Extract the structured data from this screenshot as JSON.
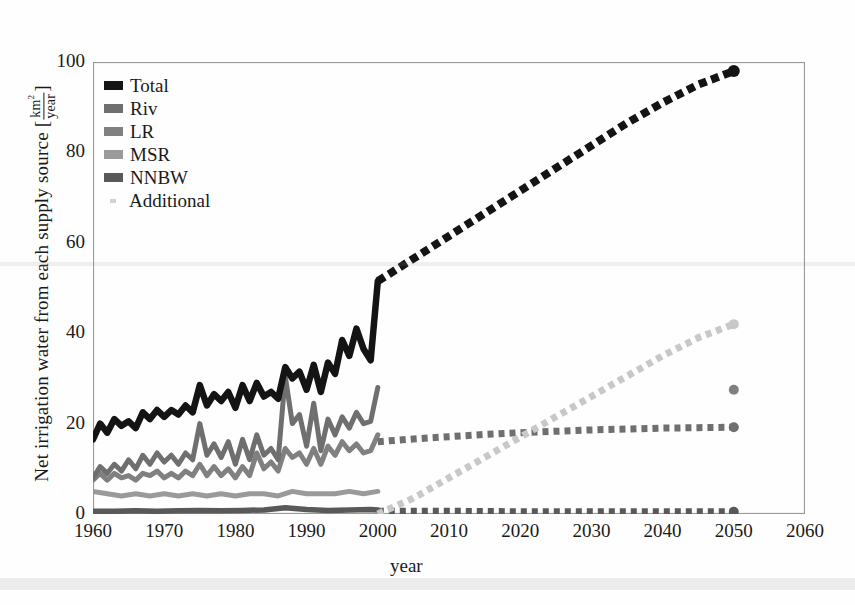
{
  "chart_data": {
    "type": "line",
    "title": "",
    "xlabel": "year",
    "ylabel": "Net irrigation water from each supply source",
    "ylabel_unit_num": "km",
    "ylabel_unit_num_sup": "2",
    "ylabel_unit_den": "year",
    "ylabel_bracket_open": "[",
    "ylabel_bracket_close": "]",
    "xlim": [
      1960,
      2060
    ],
    "ylim": [
      0,
      100
    ],
    "xticks": [
      1960,
      1970,
      1980,
      1990,
      2000,
      2010,
      2020,
      2030,
      2040,
      2050,
      2060
    ],
    "yticks": [
      0,
      20,
      40,
      60,
      80,
      100
    ],
    "grid": false,
    "legend_position": "upper-left",
    "historical_range": [
      1960,
      2000
    ],
    "projection_range": [
      2000,
      2050
    ],
    "series": [
      {
        "name": "Total",
        "color": "#141414",
        "style_historical": "solid",
        "style_projection": "dotted",
        "x": [
          1960,
          1961,
          1962,
          1963,
          1964,
          1965,
          1966,
          1967,
          1968,
          1969,
          1970,
          1971,
          1972,
          1973,
          1974,
          1975,
          1976,
          1977,
          1978,
          1979,
          1980,
          1981,
          1982,
          1983,
          1984,
          1985,
          1986,
          1987,
          1988,
          1989,
          1990,
          1991,
          1992,
          1993,
          1994,
          1995,
          1996,
          1997,
          1998,
          1999,
          2000
        ],
        "values": [
          16.5,
          20.0,
          18.0,
          21.0,
          19.5,
          20.5,
          19.0,
          22.5,
          21.0,
          23.0,
          21.5,
          23.0,
          22.0,
          24.0,
          22.5,
          28.5,
          24.0,
          26.5,
          25.0,
          27.0,
          23.5,
          28.5,
          25.0,
          29.0,
          26.0,
          27.0,
          25.5,
          32.5,
          30.0,
          31.5,
          27.5,
          33.0,
          27.0,
          33.5,
          31.0,
          38.5,
          35.0,
          41.0,
          36.5,
          34.0,
          51.5
        ],
        "projection_x": [
          2000,
          2005,
          2010,
          2015,
          2020,
          2025,
          2030,
          2035,
          2040,
          2045,
          2050
        ],
        "projection_values": [
          51.5,
          56.5,
          61.5,
          66.5,
          71.5,
          76.5,
          81.5,
          86.5,
          91.0,
          95.0,
          98.0
        ],
        "endpoint_2050": 98.0
      },
      {
        "name": "Riv",
        "color": "#6f6f6f",
        "style_historical": "solid",
        "style_projection": "dotted",
        "x": [
          1960,
          1961,
          1962,
          1963,
          1964,
          1965,
          1966,
          1967,
          1968,
          1969,
          1970,
          1971,
          1972,
          1973,
          1974,
          1975,
          1976,
          1977,
          1978,
          1979,
          1980,
          1981,
          1982,
          1983,
          1984,
          1985,
          1986,
          1987,
          1988,
          1989,
          1990,
          1991,
          1992,
          1993,
          1994,
          1995,
          1996,
          1997,
          1998,
          1999,
          2000
        ],
        "values": [
          8.0,
          10.5,
          9.0,
          11.0,
          9.5,
          12.0,
          10.0,
          13.0,
          11.0,
          13.5,
          11.5,
          13.0,
          11.0,
          13.5,
          12.0,
          20.0,
          13.0,
          15.5,
          12.5,
          16.0,
          11.0,
          16.5,
          12.0,
          17.5,
          13.0,
          14.5,
          12.0,
          30.5,
          20.0,
          22.0,
          15.0,
          24.5,
          14.0,
          21.0,
          17.5,
          21.5,
          19.0,
          22.5,
          20.0,
          20.5,
          28.0
        ],
        "projection_x": [
          2000,
          2005,
          2010,
          2015,
          2020,
          2025,
          2030,
          2035,
          2040,
          2045,
          2050
        ],
        "projection_values": [
          16.0,
          16.6,
          17.1,
          17.6,
          18.0,
          18.3,
          18.6,
          18.8,
          19.0,
          19.1,
          19.2
        ],
        "endpoint_2050": 19.2
      },
      {
        "name": "LR",
        "color": "#808080",
        "style_historical": "solid",
        "style_projection": "marker-only",
        "x": [
          1960,
          1961,
          1962,
          1963,
          1964,
          1965,
          1966,
          1967,
          1968,
          1969,
          1970,
          1971,
          1972,
          1973,
          1974,
          1975,
          1976,
          1977,
          1978,
          1979,
          1980,
          1981,
          1982,
          1983,
          1984,
          1985,
          1986,
          1987,
          1988,
          1989,
          1990,
          1991,
          1992,
          1993,
          1994,
          1995,
          1996,
          1997,
          1998,
          1999,
          2000
        ],
        "values": [
          7.5,
          9.0,
          7.5,
          9.0,
          8.0,
          8.5,
          7.5,
          9.0,
          8.5,
          9.5,
          8.0,
          9.0,
          8.0,
          9.5,
          8.5,
          11.0,
          8.5,
          10.5,
          8.5,
          10.0,
          8.0,
          10.5,
          8.5,
          13.5,
          10.0,
          11.5,
          9.5,
          14.5,
          12.5,
          13.5,
          11.0,
          14.5,
          11.0,
          15.0,
          13.0,
          16.0,
          14.0,
          15.5,
          13.5,
          14.0,
          17.5
        ],
        "endpoint_2050": 27.5
      },
      {
        "name": "MSR",
        "color": "#9a9a9a",
        "style_historical": "solid",
        "style_projection": "none",
        "x": [
          1960,
          1962,
          1964,
          1966,
          1968,
          1970,
          1972,
          1974,
          1976,
          1978,
          1980,
          1982,
          1984,
          1986,
          1988,
          1990,
          1992,
          1994,
          1996,
          1998,
          2000
        ],
        "values": [
          5.0,
          4.5,
          4.0,
          4.5,
          4.0,
          4.5,
          4.0,
          4.5,
          4.0,
          4.5,
          4.0,
          4.5,
          4.5,
          4.0,
          5.0,
          4.5,
          4.5,
          4.5,
          5.0,
          4.5,
          5.0
        ]
      },
      {
        "name": "NNBW",
        "color": "#595959",
        "style_historical": "solid",
        "style_projection": "dotted",
        "x": [
          1960,
          1963,
          1966,
          1969,
          1972,
          1975,
          1978,
          1981,
          1984,
          1987,
          1990,
          1993,
          1996,
          1999,
          2000
        ],
        "values": [
          0.6,
          0.6,
          0.7,
          0.6,
          0.7,
          0.8,
          0.7,
          0.8,
          0.9,
          1.4,
          1.0,
          0.8,
          0.9,
          1.0,
          0.9
        ],
        "projection_x": [
          2000,
          2010,
          2020,
          2030,
          2040,
          2050
        ],
        "projection_values": [
          0.6,
          0.6,
          0.5,
          0.5,
          0.5,
          0.5
        ],
        "endpoint_2050": 0.5
      },
      {
        "name": "Additional",
        "color": "#c8c8c8",
        "style_historical": "none",
        "style_projection": "dotted",
        "projection_x": [
          2000,
          2005,
          2010,
          2015,
          2020,
          2025,
          2030,
          2035,
          2040,
          2045,
          2050
        ],
        "projection_values": [
          0.0,
          3.5,
          8.0,
          12.5,
          17.0,
          21.5,
          26.0,
          30.5,
          35.0,
          39.0,
          42.0
        ],
        "endpoint_2050": 42.0
      }
    ],
    "legend": [
      {
        "label": "Total",
        "color": "#141414",
        "marker": "square"
      },
      {
        "label": "Riv",
        "color": "#6f6f6f",
        "marker": "square"
      },
      {
        "label": "LR",
        "color": "#808080",
        "marker": "square"
      },
      {
        "label": "MSR",
        "color": "#9a9a9a",
        "marker": "square"
      },
      {
        "label": "NNBW",
        "color": "#595959",
        "marker": "square"
      },
      {
        "label": "Additional",
        "color": "#d2d2d2",
        "marker": "dot"
      }
    ]
  }
}
